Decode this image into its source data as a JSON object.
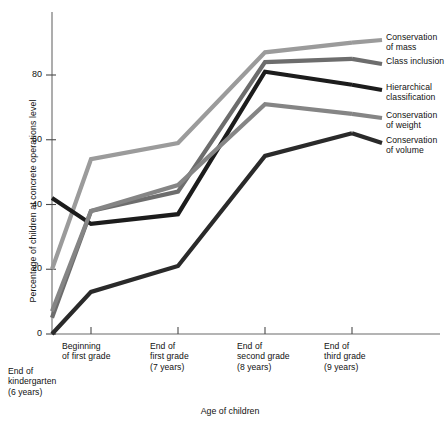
{
  "chart_data": {
    "type": "line",
    "title": "",
    "xlabel": "Age of children",
    "ylabel": "Percentage of children at concrete operations level",
    "ylim": [
      0,
      95
    ],
    "yticks": [
      0,
      20,
      40,
      60,
      80
    ],
    "ytick_labels": [
      "0",
      "20",
      "40",
      "60",
      "80"
    ],
    "grid": false,
    "legend_position": "right-inline-leader-lines",
    "categories": [
      "End of kindergarten (6 years)",
      "Beginning of first grade",
      "End of first grade (7 years)",
      "End of second grade (8 years)",
      "End of third grade (9 years)"
    ],
    "category_labels": [
      {
        "line1": "End of",
        "line2": "kindergarten",
        "line3": "(6 years)"
      },
      {
        "line1": "Beginning",
        "line2": "of first grade",
        "line3": ""
      },
      {
        "line1": "End of",
        "line2": "first grade",
        "line3": "(7 years)"
      },
      {
        "line1": "End of",
        "line2": "second grade",
        "line3": "(8 years)"
      },
      {
        "line1": "End of",
        "line2": "third grade",
        "line3": "(9 years)"
      }
    ],
    "series": [
      {
        "name": "Conservation of mass",
        "values": [
          20,
          54,
          59,
          87,
          90
        ],
        "color": "#9b9b9b"
      },
      {
        "name": "Class inclusion",
        "values": [
          5,
          38,
          44,
          84,
          85
        ],
        "color": "#6d6d6d"
      },
      {
        "name": "Hierarchical classification",
        "values": [
          42,
          34,
          37,
          81,
          77
        ],
        "color": "#1c1c1c"
      },
      {
        "name": "Conservation of weight",
        "values": [
          7,
          38,
          46,
          71,
          68
        ],
        "color": "#858585"
      },
      {
        "name": "Conservation of volume",
        "values": [
          0,
          13,
          21,
          55,
          62
        ],
        "color": "#2a2a2a"
      }
    ]
  },
  "legend": {
    "entries": [
      {
        "label_line1": "Conservation",
        "label_line2": "of mass",
        "color": "#9b9b9b"
      },
      {
        "label_line1": "Class inclusion",
        "label_line2": "",
        "color": "#6d6d6d"
      },
      {
        "label_line1": "Hierarchical",
        "label_line2": "classification",
        "color": "#1c1c1c"
      },
      {
        "label_line1": "Conservation",
        "label_line2": "of weight",
        "color": "#858585"
      },
      {
        "label_line1": "Conservation",
        "label_line2": "of volume",
        "color": "#2a2a2a"
      }
    ]
  },
  "axes": {
    "y_title": "Percentage of children at concrete operations level",
    "x_title": "Age of children"
  }
}
